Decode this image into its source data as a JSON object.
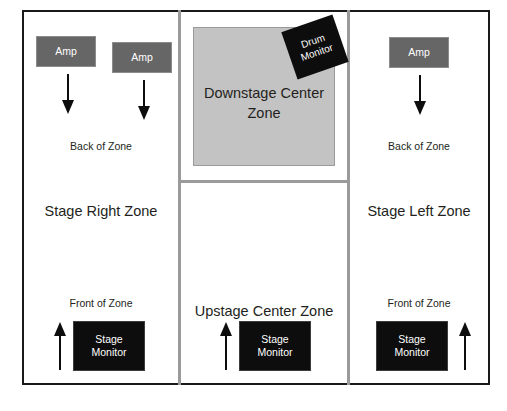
{
  "diagram": {
    "colors": {
      "frame_border": "#1a1a1a",
      "divider": "#9a9a9a",
      "amp_fill": "#666666",
      "monitor_fill": "#0d0d0d",
      "downstage_fill": "#c3c3c3",
      "text": "#231f20",
      "inverse_text": "#ffffff",
      "background": "#ffffff"
    },
    "zones": [
      {
        "id": "stage-right",
        "title": "Stage Right Zone",
        "back_label": "Back of Zone",
        "front_label": "Front of Zone",
        "amps": [
          {
            "label": "Amp"
          },
          {
            "label": "Amp"
          }
        ],
        "monitors": [
          {
            "line1": "Stage",
            "line2": "Monitor"
          }
        ],
        "arrows": [
          {
            "direction": "down"
          },
          {
            "direction": "down"
          },
          {
            "direction": "up"
          }
        ]
      },
      {
        "id": "downstage-center",
        "title": "Downstage Center",
        "title_line2": "Zone",
        "drum_monitor": {
          "line1": "Drum",
          "line2": "Monitor"
        }
      },
      {
        "id": "upstage-center",
        "title": "Upstage Center Zone",
        "monitors": [
          {
            "line1": "Stage",
            "line2": "Monitor"
          }
        ],
        "arrows": [
          {
            "direction": "up"
          }
        ]
      },
      {
        "id": "stage-left",
        "title": "Stage Left Zone",
        "back_label": "Back of Zone",
        "front_label": "Front of Zone",
        "amps": [
          {
            "label": "Amp"
          }
        ],
        "monitors": [
          {
            "line1": "Stage",
            "line2": "Monitor"
          }
        ],
        "arrows": [
          {
            "direction": "down"
          },
          {
            "direction": "up"
          }
        ]
      }
    ]
  }
}
